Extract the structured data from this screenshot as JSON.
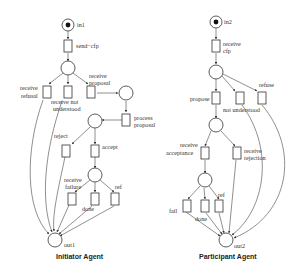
{
  "initiator": {
    "title": "Initiator Agent",
    "places": {
      "in": "in1",
      "out": "out1"
    },
    "transitions": {
      "send_cfp": "send−cfp",
      "receive_refusal_1": "receive",
      "receive_refusal_2": "refusal",
      "receive_not_understood_1": "receive  not",
      "receive_not_understood_2": "understood",
      "receive_proposal_1": "receive",
      "receive_proposal_2": "proposal",
      "process_proposal_1": "process",
      "process_proposal_2": "proposal",
      "reject": "reject",
      "accept": "accept",
      "receive_failure_1": "receive",
      "receive_failure_2": "failure",
      "done": "done",
      "ref": "ref"
    }
  },
  "participant": {
    "title": "Participant Agent",
    "places": {
      "in": "in2",
      "out": "out2"
    },
    "transitions": {
      "receive_cfp_1": "receive",
      "receive_cfp_2": "cfp",
      "propose": "propose",
      "not_understood": "not understood",
      "refuse": "refuse",
      "receive_acceptance_1": "receive",
      "receive_acceptance_2": "acceptance",
      "receive_rejection_1": "receive",
      "receive_rejection_2": "rejection",
      "fail": "fail",
      "done": "done",
      "ref": "ref"
    }
  },
  "colors": {
    "stroke": "#333333",
    "background": "#ffffff",
    "token": "#111111"
  }
}
